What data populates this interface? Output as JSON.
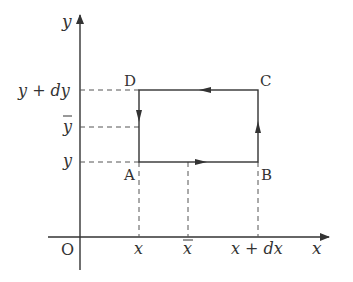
{
  "diagram": {
    "type": "coordinate-rectangle-circulation",
    "colors": {
      "line": "#333333",
      "dash": "#555555",
      "background": "#ffffff"
    },
    "axes": {
      "x_label": "x",
      "y_label": "y",
      "origin_label": "O"
    },
    "vertices": {
      "A": "A",
      "B": "B",
      "C": "C",
      "D": "D"
    },
    "y_ticks": {
      "top": "y + dy",
      "mid": "y",
      "bottom": "y"
    },
    "x_ticks": {
      "left": "x",
      "mid": "x",
      "right": "x + dx"
    },
    "bar_marks": {
      "y_mid": "overline",
      "x_mid": "overline"
    },
    "arrows": [
      {
        "edge": "A-B",
        "direction": "right"
      },
      {
        "edge": "B-C",
        "direction": "up"
      },
      {
        "edge": "C-D",
        "direction": "left"
      },
      {
        "edge": "D-A",
        "direction": "down"
      }
    ]
  }
}
